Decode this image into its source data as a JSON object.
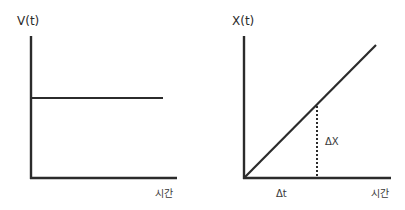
{
  "diagrams": [
    {
      "id": "velocity-time",
      "y_label": "V(t)",
      "x_label": "시간",
      "description": "constant velocity over time"
    },
    {
      "id": "position-time",
      "y_label": "X(t)",
      "x_label": "시간",
      "description": "position increases linearly over time",
      "annotations": {
        "delta_x": "ΔX",
        "delta_t": "Δt"
      }
    }
  ]
}
